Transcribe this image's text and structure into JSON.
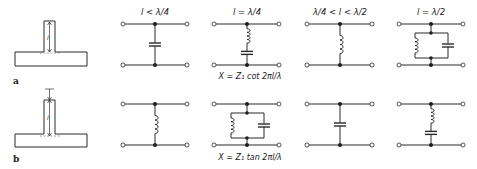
{
  "figure": {
    "rows": [
      {
        "id": "a",
        "label": "a",
        "stub_type": "open-circuited stub",
        "length_symbol": "l",
        "formula": "X = Z₁ cot 2πl/λ",
        "circuits": [
          {
            "condition": "l < λ/4",
            "element": "capacitor"
          },
          {
            "condition": "l = λ/4",
            "element": "series-lc"
          },
          {
            "condition": "λ/4 < l < λ/2",
            "element": "inductor"
          },
          {
            "condition": "l = λ/2",
            "element": "parallel-lc"
          }
        ]
      },
      {
        "id": "b",
        "label": "b",
        "stub_type": "short-circuited stub",
        "length_symbol": "l",
        "formula": "X = Z₁ tan 2πl/λ",
        "circuits": [
          {
            "condition": "",
            "element": "inductor"
          },
          {
            "condition": "",
            "element": "parallel-lc"
          },
          {
            "condition": "",
            "element": "capacitor"
          },
          {
            "condition": "",
            "element": "series-lc"
          }
        ]
      }
    ]
  }
}
